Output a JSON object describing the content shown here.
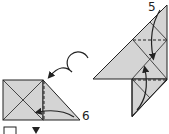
{
  "diagram": {
    "type": "origami-instructions",
    "steps": [
      {
        "number": "5",
        "description": "Fold flaps along dashed lines (valley folds) toward center"
      },
      {
        "number": "6",
        "description": "Valley fold triangle flap over along dashed line; turn model over"
      }
    ],
    "symbols": {
      "turn_over": "turn-over-arrow",
      "bottom_square": "square-outline",
      "bottom_triangle": "triangle-down"
    },
    "colors": {
      "paper": "#d4d4d4",
      "line": "#222222",
      "background": "#ffffff"
    }
  }
}
